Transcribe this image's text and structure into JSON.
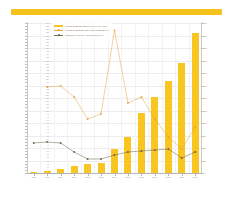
{
  "header": {
    "banner_color": "#f5c21b"
  },
  "caption": {
    "text": "Quelle: B I T K O M  -  Bundesverband Informationswirtschaft, Telekommunikation und neue Medien e.V."
  },
  "legend": {
    "position": "upper-left",
    "items": [
      {
        "label": "Umsatz BREITBANDZUGANG in Mio. EUR",
        "type": "bar",
        "color": "#f8c521"
      },
      {
        "label": "Wachstum BREITBANDANSCHLUESSE in %",
        "type": "line",
        "color": "#e8a33d"
      },
      {
        "label": "Marktanteil T-Mobile / Deutschland in %",
        "type": "line",
        "color": "#6b5f4c"
      }
    ]
  },
  "chart_data": {
    "type": "bar",
    "title": "",
    "subtitle": "",
    "xlabel": "",
    "ylabel": "",
    "grid": true,
    "categories": [
      "1998",
      "1999",
      "2000",
      "2001",
      "2002",
      "2003",
      "2004",
      "2005",
      "2006",
      "2007",
      "2008",
      "2009",
      "2010"
    ],
    "series": [
      {
        "name": "Umsatz BREITBANDZUGANG in Mio. EUR",
        "type": "bar",
        "axis": "left",
        "color": "#f8c521",
        "values": [
          1,
          4,
          6,
          11,
          14,
          16,
          38,
          57,
          96,
          121,
          147,
          176,
          224
        ]
      },
      {
        "name": "Wachstum BREITBANDANSCHLUESSE in %",
        "type": "line",
        "axis": "right",
        "color": "#e8a33d",
        "values": [
          null,
          172,
          174,
          152,
          108,
          118,
          285,
          140,
          152,
          108,
          72,
          48,
          92
        ]
      },
      {
        "name": "Marktanteil T-Mobile / Deutschland in %",
        "type": "line",
        "axis": "right",
        "color": "#6b5f4c",
        "values": [
          60,
          62,
          60,
          42,
          28,
          28,
          36,
          42,
          44,
          46,
          48,
          30,
          42
        ]
      }
    ],
    "left_axis": {
      "min": 0,
      "max": 240,
      "tick_labels": [
        "240",
        "235",
        "230",
        "225",
        "220",
        "215",
        "210",
        "205",
        "200",
        "195",
        "190",
        "185",
        "180",
        "175",
        "170",
        "165",
        "160",
        "155",
        "150",
        "145",
        "140",
        "135",
        "130",
        "125",
        "120",
        "115",
        "110",
        "105",
        "100",
        "95",
        "90",
        "85",
        "80",
        "75",
        "70",
        "65",
        "60",
        "55",
        "50",
        "45",
        "40",
        "35",
        "30",
        "25",
        "20",
        "15",
        "10",
        "5",
        "0"
      ]
    },
    "right_axis": {
      "min": 0,
      "max": 300,
      "tick_labels": [
        "300",
        "275",
        "250",
        "225",
        "200",
        "175",
        "150",
        "125",
        "100",
        "75",
        "50",
        "25",
        "0"
      ]
    }
  }
}
